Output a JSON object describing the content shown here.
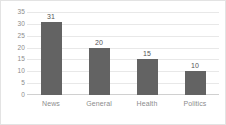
{
  "chart_data": {
    "type": "bar",
    "title": "",
    "subtitle": "",
    "xlabel": "",
    "ylabel": "",
    "categories": [
      "News",
      "General",
      "Health",
      "Politics"
    ],
    "values": [
      31,
      20,
      15,
      10
    ],
    "data_labels": [
      "31",
      "20",
      "15",
      "10"
    ],
    "ylim": [
      0,
      35
    ],
    "ytick_step": 5,
    "yticks": [
      "35",
      "30",
      "25",
      "20",
      "15",
      "10",
      "5",
      "0"
    ],
    "grid": "horizontal",
    "legend": "none",
    "colors": {
      "bar": "#636363",
      "gridline": "#e8e8e8",
      "axis": "#d0d0d0",
      "tick_text": "#8c8c8c",
      "value_text": "#555555",
      "background": "#ffffff",
      "border": "#e3e3e3"
    }
  }
}
